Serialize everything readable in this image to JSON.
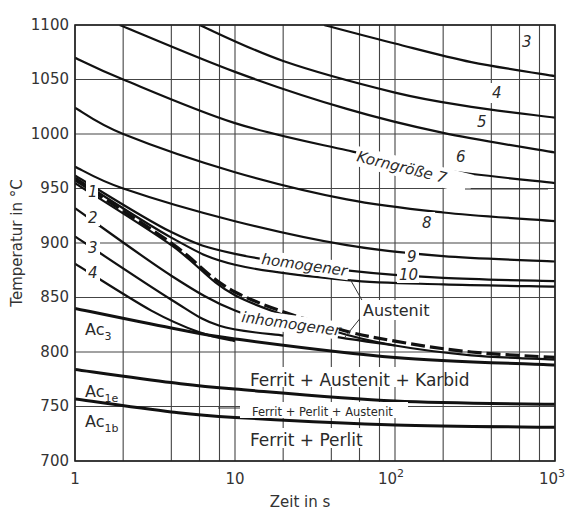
{
  "chart_data": {
    "type": "line",
    "title": "",
    "xlabel": "Zeit in s",
    "ylabel": "Temperatur in °C",
    "xscale": "log",
    "xlim": [
      1,
      1000
    ],
    "ylim": [
      700,
      1100
    ],
    "grid": true,
    "x_ticks": [
      {
        "value": 1,
        "label": "1"
      },
      {
        "value": 10,
        "label": "10"
      },
      {
        "value": 100,
        "label": "10",
        "sup": "2"
      },
      {
        "value": 1000,
        "label": "10",
        "sup": "3"
      }
    ],
    "x_gridlines": [
      1,
      2,
      4,
      6,
      8,
      10,
      20,
      40,
      60,
      80,
      100,
      200,
      400,
      600,
      800,
      1000
    ],
    "y_ticks": [
      700,
      750,
      800,
      850,
      900,
      950,
      1000,
      1050,
      1100
    ],
    "series": [
      {
        "name": "Korngröße 3",
        "label": "3",
        "points": [
          [
            36,
            1100
          ],
          [
            100,
            1083
          ],
          [
            300,
            1066
          ],
          [
            1000,
            1053
          ]
        ]
      },
      {
        "name": "Korngröße 4",
        "label": "4",
        "points": [
          [
            6,
            1100
          ],
          [
            20,
            1067
          ],
          [
            100,
            1038
          ],
          [
            300,
            1025
          ],
          [
            1000,
            1015
          ]
        ]
      },
      {
        "name": "Korngröße 5",
        "label": "5",
        "points": [
          [
            1.9,
            1100
          ],
          [
            10,
            1057
          ],
          [
            50,
            1023
          ],
          [
            200,
            1001
          ],
          [
            1000,
            983
          ]
        ]
      },
      {
        "name": "Korngröße 6",
        "label": "6",
        "points": [
          [
            1,
            1070
          ],
          [
            2,
            1050
          ],
          [
            10,
            1010
          ],
          [
            50,
            985
          ],
          [
            200,
            967
          ],
          [
            1000,
            955
          ]
        ]
      },
      {
        "name": "Korngröße 7",
        "label": "Korngröße 7",
        "points": [
          [
            1,
            1024
          ],
          [
            2,
            1000
          ],
          [
            10,
            965
          ],
          [
            50,
            940
          ],
          [
            200,
            928
          ],
          [
            1000,
            920
          ]
        ]
      },
      {
        "name": "Korngröße 8",
        "label": "8",
        "points": [
          [
            1,
            970
          ],
          [
            2,
            950
          ],
          [
            10,
            920
          ],
          [
            50,
            898
          ],
          [
            200,
            888
          ],
          [
            1000,
            883
          ]
        ]
      },
      {
        "name": "Korngröße 9",
        "label": "9",
        "points": [
          [
            1,
            962
          ],
          [
            4,
            910
          ],
          [
            10,
            890
          ],
          [
            50,
            875
          ],
          [
            200,
            868
          ],
          [
            1000,
            865
          ]
        ]
      },
      {
        "name": "Korngröße 10",
        "label": "10",
        "points": [
          [
            1,
            960
          ],
          [
            4,
            905
          ],
          [
            10,
            880
          ],
          [
            50,
            866
          ],
          [
            200,
            862
          ],
          [
            1000,
            860
          ]
        ]
      },
      {
        "name": "homogener Austenit (dashed)",
        "style": "dashed",
        "points": [
          [
            1,
            958
          ],
          [
            4,
            900
          ],
          [
            10,
            855
          ],
          [
            40,
            823
          ],
          [
            100,
            810
          ],
          [
            300,
            800
          ],
          [
            1000,
            795
          ]
        ]
      },
      {
        "name": "Curve 1",
        "label": "1",
        "points": [
          [
            1,
            955
          ],
          [
            4,
            898
          ],
          [
            10,
            852
          ],
          [
            40,
            820
          ],
          [
            100,
            806
          ],
          [
            300,
            797
          ],
          [
            1000,
            793
          ]
        ]
      },
      {
        "name": "Curve 2",
        "label": "2",
        "points": [
          [
            1,
            932
          ],
          [
            4,
            870
          ],
          [
            10,
            838
          ],
          [
            30,
            818
          ],
          [
            100,
            806
          ]
        ]
      },
      {
        "name": "Curve 3",
        "label": "3",
        "points": [
          [
            1,
            906
          ],
          [
            4,
            848
          ],
          [
            8,
            824
          ],
          [
            20,
            815
          ]
        ]
      },
      {
        "name": "Curve 4",
        "label": "4",
        "points": [
          [
            1,
            881
          ],
          [
            3,
            838
          ],
          [
            6,
            818
          ],
          [
            10,
            810
          ]
        ]
      },
      {
        "name": "Ac3",
        "label": "Ac3",
        "points": [
          [
            1,
            840
          ],
          [
            4,
            822
          ],
          [
            10,
            812
          ],
          [
            100,
            795
          ],
          [
            1000,
            788
          ]
        ]
      },
      {
        "name": "Ac1e",
        "label": "Ac1e",
        "points": [
          [
            1,
            784
          ],
          [
            4,
            772
          ],
          [
            10,
            766
          ],
          [
            100,
            755
          ],
          [
            1000,
            752
          ]
        ]
      },
      {
        "name": "Ac1b",
        "label": "Ac1b",
        "points": [
          [
            1,
            757
          ],
          [
            4,
            745
          ],
          [
            10,
            740
          ],
          [
            100,
            733
          ],
          [
            1000,
            731
          ]
        ]
      }
    ],
    "annotations": [
      "Korngröße 7",
      "3",
      "4",
      "5",
      "6",
      "8",
      "9",
      "10",
      "1",
      "2",
      "3",
      "4",
      "homogener",
      "inhomogener",
      "Austenit",
      "Ac3",
      "Ac1e",
      "Ac1b",
      "Ferrit + Austenit + Karbid",
      "Ferrit + Perlit + Austenit",
      "Ferrit + Perlit"
    ]
  },
  "labels": {
    "ylabel": "Temperatur in °C",
    "xlabel": "Zeit in s",
    "y_ticks": [
      "1100",
      "1050",
      "1000",
      "950",
      "900",
      "850",
      "800",
      "750",
      "700"
    ],
    "x_tick_1": "1",
    "x_tick_10": "10",
    "x_tick_100_base": "10",
    "x_tick_100_sup": "2",
    "x_tick_1000_base": "10",
    "x_tick_1000_sup": "3",
    "grain_3": "3",
    "grain_4": "4",
    "grain_5": "5",
    "grain_6": "6",
    "grain_7": "Korngröße 7",
    "grain_8": "8",
    "grain_9": "9",
    "grain_10": "10",
    "curve_1": "1",
    "curve_2": "2",
    "curve_3": "3",
    "curve_4": "4",
    "homogener": "homogener",
    "inhomogener": "inhomogener",
    "austenit": "Austenit",
    "ac3_base": "Ac",
    "ac3_sub": "3",
    "ac1e_base": "Ac",
    "ac1e_sub": "1e",
    "ac1b_base": "Ac",
    "ac1b_sub": "1b",
    "region_fak": "Ferrit + Austenit + Karbid",
    "region_fpa": "Ferrit + Perlit + Austenit",
    "region_fp": "Ferrit + Perlit"
  }
}
